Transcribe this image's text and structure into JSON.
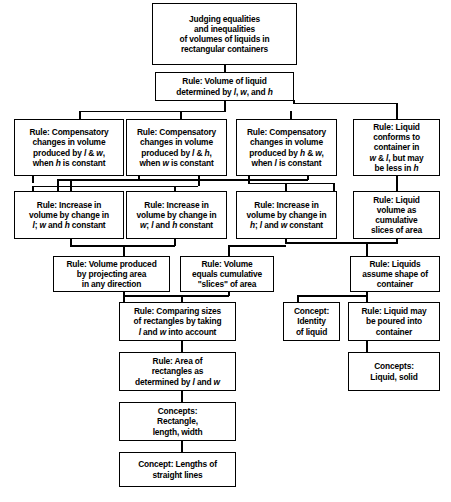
{
  "diagram": {
    "type": "hierarchical-flowchart",
    "orientation": "top-down",
    "background_color": "#ffffff",
    "line_color": "#000000",
    "text_color": "#000000",
    "nodes": [
      {
        "id": "goal",
        "kind": "goal",
        "text": "Judging equalities\nand inequalities\nof volumes of liquids in\nrectangular containers"
      },
      {
        "id": "rule-volume-determined",
        "kind": "rule",
        "text": "Rule: Volume of liquid\ndetermined by l, w, and  h"
      },
      {
        "id": "rule-comp-lw",
        "kind": "rule",
        "text": "Rule: Compensatory\nchanges in volume\nproduced by l & w,\nwhen h is constant"
      },
      {
        "id": "rule-comp-lh",
        "kind": "rule",
        "text": "Rule: Compensatory\nchanges in volume\nproduced by l & h,\nwhen w is constant"
      },
      {
        "id": "rule-comp-hw",
        "kind": "rule",
        "text": "Rule: Compensatory\nchanges in volume\nproduced by h & w,\nwhen l is constant"
      },
      {
        "id": "rule-liquid-conforms",
        "kind": "rule",
        "text": "Rule: Liquid\nconforms to\ncontainer in\nw & l, but may\nbe less in h"
      },
      {
        "id": "rule-increase-l",
        "kind": "rule",
        "text": "Rule: Increase in\nvolume by change in\nl; w and h constant"
      },
      {
        "id": "rule-increase-w",
        "kind": "rule",
        "text": "Rule: Increase in\nvolume by change in\nw; l and h constant"
      },
      {
        "id": "rule-increase-h",
        "kind": "rule",
        "text": "Rule: Increase in\nvolume by change in\nh; l and w constant"
      },
      {
        "id": "rule-liquid-volume-slices",
        "kind": "rule",
        "text": "Rule: Liquid\nvolume as\ncumulative\nslices of area"
      },
      {
        "id": "rule-volume-projecting",
        "kind": "rule",
        "text": "Rule: Volume produced\nby projecting area\nin any direction"
      },
      {
        "id": "rule-volume-equals-slices",
        "kind": "rule",
        "text": "Rule: Volume\nequals cumulative\n\"slices\" of area"
      },
      {
        "id": "rule-liquids-assume-shape",
        "kind": "rule",
        "text": "Rule: Liquids\nassume shape of\ncontainer"
      },
      {
        "id": "rule-comparing-sizes",
        "kind": "rule",
        "text": "Rule: Comparing sizes\nof rectangles by taking\nl and w into account"
      },
      {
        "id": "concept-identity-liquid",
        "kind": "concept",
        "text": "Concept:\nIdentity\nof liquid"
      },
      {
        "id": "rule-liquid-poured",
        "kind": "rule",
        "text": "Rule: Liquid may\nbe poured into\ncontainer"
      },
      {
        "id": "rule-area-rectangles",
        "kind": "rule",
        "text": "Rule: Area of\nrectangles as\ndetermined by l and w"
      },
      {
        "id": "concepts-liquid-solid",
        "kind": "concept",
        "text": "Concepts:\nLiquid, solid"
      },
      {
        "id": "concepts-rectangle",
        "kind": "concept",
        "text": "Concepts:\nRectangle,\nlength, width"
      },
      {
        "id": "concept-lengths",
        "kind": "concept",
        "text": "Concept: Lengths of\nstraight lines"
      }
    ]
  }
}
